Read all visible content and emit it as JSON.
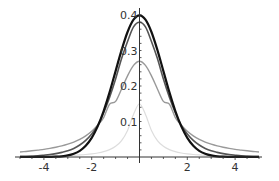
{
  "chart_data": {
    "type": "line",
    "title": "",
    "xlabel": "",
    "ylabel": "",
    "xlim": [
      -5,
      5
    ],
    "ylim": [
      0,
      0.4
    ],
    "grid": false,
    "legend": null,
    "x_ticks": [
      -4,
      -2,
      2,
      4
    ],
    "x_tick_labels": [
      "-4",
      "-2",
      "2",
      "4"
    ],
    "y_ticks": [
      0.1,
      0.2,
      0.3,
      0.4
    ],
    "y_tick_labels": [
      "0.1",
      "0.2",
      "0.3",
      "0.4"
    ],
    "x": [
      -5,
      -4.75,
      -4.5,
      -4.25,
      -4,
      -3.75,
      -3.5,
      -3.25,
      -3,
      -2.75,
      -2.5,
      -2.25,
      -2,
      -1.75,
      -1.5,
      -1.25,
      -1,
      -0.75,
      -0.5,
      -0.25,
      0,
      0.25,
      0.5,
      0.75,
      1,
      1.25,
      1.5,
      1.75,
      2,
      2.25,
      2.5,
      2.75,
      3,
      3.25,
      3.5,
      3.75,
      4,
      4.25,
      4.5,
      4.75,
      5
    ],
    "series": [
      {
        "name": "curve-black",
        "color": "#111111",
        "width": 2.2,
        "values": [
          0.0,
          0.0,
          0.0,
          0.0001,
          0.0001,
          0.0004,
          0.0009,
          0.002,
          0.0044,
          0.0091,
          0.0175,
          0.0317,
          0.054,
          0.0863,
          0.1295,
          0.1826,
          0.242,
          0.3011,
          0.3521,
          0.3867,
          0.3989,
          0.3867,
          0.3521,
          0.3011,
          0.242,
          0.1826,
          0.1295,
          0.0863,
          0.054,
          0.0317,
          0.0175,
          0.0091,
          0.0044,
          0.002,
          0.0009,
          0.0004,
          0.0001,
          0.0001,
          0.0,
          0.0,
          0.0
        ]
      },
      {
        "name": "curve-dark-gray",
        "color": "#555555",
        "width": 1.6,
        "values": [
          0.0018,
          0.0022,
          0.0028,
          0.0036,
          0.0051,
          0.0069,
          0.0095,
          0.0131,
          0.0173,
          0.0241,
          0.0338,
          0.047,
          0.0651,
          0.0887,
          0.1245,
          0.1684,
          0.2197,
          0.2773,
          0.3254,
          0.3664,
          0.3796,
          0.3664,
          0.3254,
          0.2773,
          0.2197,
          0.1684,
          0.1245,
          0.0887,
          0.0651,
          0.047,
          0.0338,
          0.0241,
          0.0173,
          0.0131,
          0.0095,
          0.0069,
          0.0051,
          0.0036,
          0.0028,
          0.0022,
          0.0018
        ]
      },
      {
        "name": "curve-mid-gray",
        "color": "#999999",
        "width": 1.4,
        "values": [
          0.0142,
          0.0157,
          0.0175,
          0.0195,
          0.0216,
          0.0243,
          0.0275,
          0.0313,
          0.0361,
          0.0421,
          0.0497,
          0.0596,
          0.0726,
          0.0893,
          0.111,
          0.1489,
          0.1566,
          0.1917,
          0.2286,
          0.258,
          0.2697,
          0.258,
          0.2286,
          0.1917,
          0.1566,
          0.1489,
          0.111,
          0.0893,
          0.0726,
          0.0596,
          0.0497,
          0.0421,
          0.0361,
          0.0313,
          0.0275,
          0.0243,
          0.0216,
          0.0195,
          0.0175,
          0.0157,
          0.0142
        ]
      },
      {
        "name": "curve-faint",
        "color": "#dddddd",
        "width": 1.2,
        "values": [
          0.0015,
          0.0017,
          0.0018,
          0.0021,
          0.0023,
          0.0026,
          0.003,
          0.0035,
          0.0041,
          0.0048,
          0.0058,
          0.0071,
          0.0088,
          0.0113,
          0.015,
          0.0207,
          0.03,
          0.0462,
          0.075,
          0.12,
          0.15,
          0.12,
          0.075,
          0.0462,
          0.03,
          0.0207,
          0.015,
          0.0113,
          0.0088,
          0.0071,
          0.0058,
          0.0048,
          0.0041,
          0.0035,
          0.003,
          0.0026,
          0.0023,
          0.0021,
          0.0018,
          0.0017,
          0.0015
        ]
      }
    ]
  },
  "plot": {
    "origin_px": [
      139.5,
      157
    ],
    "x_px_per_unit": 23.9,
    "y_px_per_unit": 355,
    "axis_color": "#333333"
  }
}
